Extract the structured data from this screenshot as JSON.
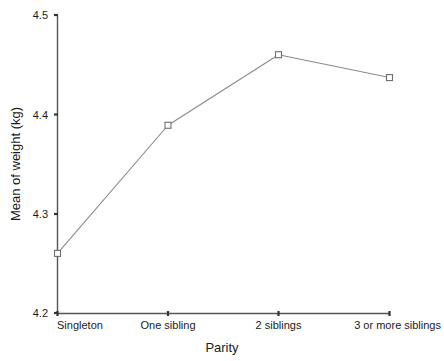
{
  "chart_data": {
    "type": "line",
    "title": "",
    "xlabel": "Parity",
    "ylabel": "Mean of weight (kg)",
    "categories": [
      "Singleton",
      "One sibling",
      "2 siblings",
      "3 or more siblings"
    ],
    "values": [
      4.26,
      4.389,
      4.46,
      4.437
    ],
    "series": [
      {
        "name": "Mean of weight (kg)",
        "values": [
          4.26,
          4.389,
          4.46,
          4.437
        ]
      }
    ],
    "ylim": [
      4.2,
      4.5
    ],
    "ytick_labels": [
      "4.5",
      "4.4",
      "4.3",
      "4.2"
    ],
    "ytick_values": [
      4.5,
      4.4,
      4.3,
      4.2
    ],
    "grid": false,
    "legend": "none",
    "marker": "open-square",
    "line_color": "#8a8a8a",
    "marker_color": "#6e6e6e",
    "axis_color": "#555555",
    "text_color": "#1a1a1a",
    "background": "#ffffff"
  },
  "axes": {
    "y_title": "Mean of weight (kg)",
    "x_title": "Parity",
    "y_ticks": [
      {
        "label": "4.5",
        "value": 4.5
      },
      {
        "label": "4.4",
        "value": 4.4
      },
      {
        "label": "4.3",
        "value": 4.3
      },
      {
        "label": "4.2",
        "value": 4.2
      }
    ],
    "x_ticks": [
      {
        "label": "Singleton"
      },
      {
        "label": "One sibling"
      },
      {
        "label": "2 siblings"
      },
      {
        "label": "3 or more siblings"
      }
    ]
  }
}
